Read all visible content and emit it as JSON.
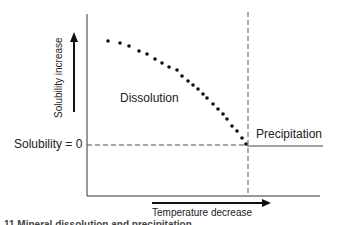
{
  "diagram": {
    "type": "solubility-vs-temperature",
    "y_axis_label": "Solubility increase",
    "x_axis_label": "Temperature decrease",
    "zero_line_label": "Solubility = 0",
    "region_left_label": "Dissolution",
    "region_right_label": "Precipitation",
    "caption_partial": "11  Mineral dissolution and precipitation",
    "colors": {
      "line": "#333333",
      "dots": "#111111",
      "dashed": "#555555"
    }
  },
  "chart_data": {
    "type": "scatter",
    "title": "",
    "xlabel": "Temperature decrease",
    "ylabel": "Solubility increase",
    "annotations": [
      "Solubility = 0",
      "Dissolution",
      "Precipitation"
    ],
    "points_px": [
      [
        108,
        41
      ],
      [
        120,
        43
      ],
      [
        129,
        46
      ],
      [
        139,
        51
      ],
      [
        147,
        54
      ],
      [
        155,
        59
      ],
      [
        162,
        63
      ],
      [
        169,
        67
      ],
      [
        177,
        70
      ],
      [
        182,
        76
      ],
      [
        188,
        81
      ],
      [
        193,
        85
      ],
      [
        198,
        89
      ],
      [
        203,
        94
      ],
      [
        207,
        98
      ],
      [
        213,
        104
      ],
      [
        218,
        109
      ],
      [
        223,
        114
      ],
      [
        227,
        119
      ],
      [
        232,
        126
      ],
      [
        237,
        131
      ],
      [
        242,
        138
      ],
      [
        246,
        144
      ]
    ],
    "threshold_x_px": 247,
    "zero_y_px": 145
  }
}
